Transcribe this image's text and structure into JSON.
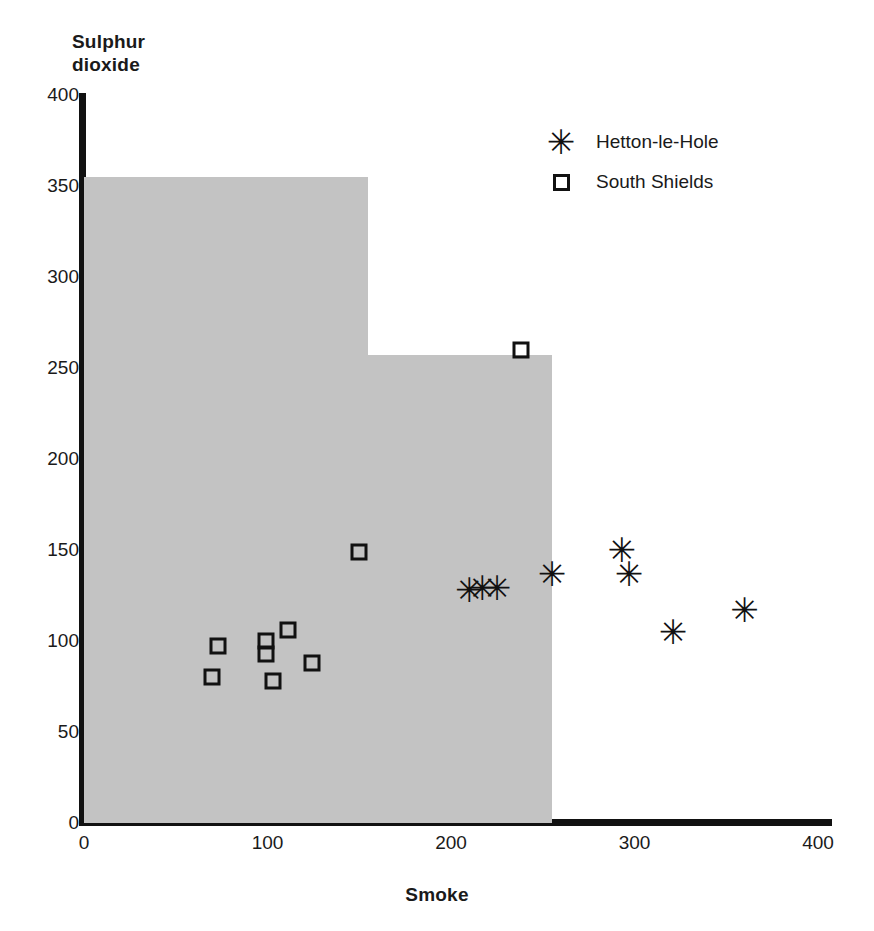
{
  "chart_data": {
    "type": "scatter",
    "title": "",
    "xlabel": "Smoke",
    "ylabel": "Sulphur dioxide",
    "ylabel_lines": [
      "Sulphur",
      "dioxide"
    ],
    "xlim": [
      0,
      400
    ],
    "ylim": [
      0,
      400
    ],
    "xticks": [
      0,
      100,
      200,
      300,
      400
    ],
    "yticks": [
      0,
      50,
      100,
      150,
      200,
      250,
      300,
      350,
      400
    ],
    "grid": false,
    "legend_position": "top-right",
    "series": [
      {
        "name": "Hetton-le-Hole",
        "marker": "asterisk",
        "marker_glyph": "✳",
        "color": "#111111",
        "points": [
          {
            "x": 210,
            "y": 128
          },
          {
            "x": 217,
            "y": 129
          },
          {
            "x": 225,
            "y": 129
          },
          {
            "x": 255,
            "y": 137
          },
          {
            "x": 293,
            "y": 150
          },
          {
            "x": 297,
            "y": 137
          },
          {
            "x": 321,
            "y": 105
          },
          {
            "x": 360,
            "y": 117
          }
        ]
      },
      {
        "name": "South Shields",
        "marker": "open-square",
        "marker_glyph": "□",
        "color": "#111111",
        "points": [
          {
            "x": 73,
            "y": 97
          },
          {
            "x": 70,
            "y": 80
          },
          {
            "x": 99,
            "y": 100
          },
          {
            "x": 99,
            "y": 93
          },
          {
            "x": 111,
            "y": 106
          },
          {
            "x": 103,
            "y": 78
          },
          {
            "x": 124,
            "y": 88
          },
          {
            "x": 150,
            "y": 149
          },
          {
            "x": 238,
            "y": 260
          }
        ]
      }
    ],
    "shaded_region": {
      "name": "EC guide value region",
      "color": "#c3c3c3",
      "steps": [
        {
          "x_start": 0,
          "x_end": 155,
          "y_top": 355
        },
        {
          "x_start": 155,
          "x_end": 255,
          "y_top": 257
        }
      ]
    }
  },
  "axes": {
    "y_title_lines": [
      "Sulphur",
      "dioxide"
    ],
    "x_title": "Smoke",
    "y_tick_labels": [
      "400",
      "350",
      "300",
      "250",
      "200",
      "150",
      "100",
      "50",
      "0"
    ],
    "x_tick_labels": [
      "0",
      "100",
      "200",
      "300",
      "400"
    ]
  },
  "legend": {
    "entries": [
      {
        "label": "Hetton-le-Hole",
        "glyph": "✳",
        "marker": "asterisk"
      },
      {
        "label": "South Shields",
        "glyph": "□",
        "marker": "open-square"
      }
    ]
  }
}
